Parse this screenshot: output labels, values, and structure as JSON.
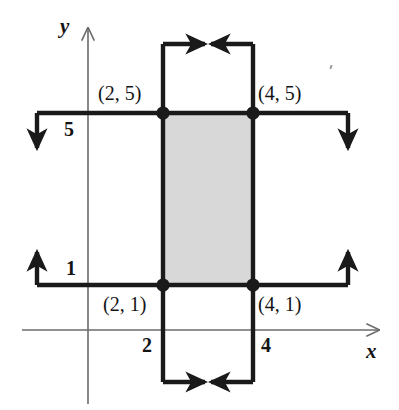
{
  "figure": {
    "background_color": "#ffffff",
    "line_color": "#1a1a1a",
    "axis_color": "#6b6b6b",
    "fill_color": "#d8d8d8"
  },
  "axes": {
    "x_label": "x",
    "y_label": "y",
    "x_axis": {
      "y_pixel": 330,
      "from_x": 22,
      "to_x": 387,
      "arrow": "right"
    },
    "y_axis": {
      "x_pixel": 88,
      "from_y": 22,
      "to_y": 404,
      "arrow": "up"
    }
  },
  "ticks": {
    "x": [
      {
        "label": "2",
        "value": 2
      },
      {
        "label": "4",
        "value": 4
      }
    ],
    "y": [
      {
        "label": "1",
        "value": 1
      },
      {
        "label": "5",
        "value": 5
      }
    ]
  },
  "points": [
    {
      "label": "(2, 5)",
      "x": 2,
      "y": 5,
      "px": 163,
      "py": 113
    },
    {
      "label": "(4, 5)",
      "x": 4,
      "y": 5,
      "px": 253,
      "py": 113
    },
    {
      "label": "(2, 1)",
      "x": 2,
      "y": 1,
      "px": 163,
      "py": 285
    },
    {
      "label": "(4, 1)",
      "x": 4,
      "y": 1,
      "px": 253,
      "py": 285
    }
  ],
  "region": {
    "description": "shaded rectangle",
    "x_range": [
      2,
      4
    ],
    "y_range": [
      1,
      5
    ],
    "fill": "#d8d8d8"
  },
  "flow_lines": {
    "top_left_segment": {
      "from": "x=2,y=5",
      "to": "left edge then down",
      "arrow": "down"
    },
    "top_right_segment": {
      "from": "x=4,y=5",
      "to": "right edge then down",
      "arrow": "down"
    },
    "bottom_left_segment": {
      "from": "x=2,y=1",
      "to": "left edge then up",
      "arrow": "up"
    },
    "bottom_right_segment": {
      "from": "x=4,y=1",
      "to": "right edge then up",
      "arrow": "up"
    },
    "above_top_connector": {
      "arrows": "inward",
      "y_pixel": 44
    },
    "below_bottom_connector": {
      "arrows": "inward",
      "y_pixel": 382
    }
  }
}
